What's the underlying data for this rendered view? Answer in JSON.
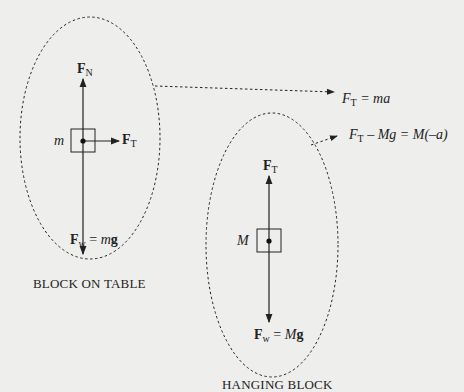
{
  "block_on_table": {
    "mass_label": "m",
    "normal_force": {
      "symbol": "F",
      "sub": "N"
    },
    "tension_force": {
      "symbol": "F",
      "sub": "T"
    },
    "weight": {
      "symbol": "F",
      "sub": "w",
      "eq": " = ",
      "m": "m",
      "g": "g"
    },
    "caption": "BLOCK ON TABLE",
    "equation": {
      "F": "F",
      "sub": "T",
      "rest": " = ma"
    }
  },
  "hanging_block": {
    "mass_label": "M",
    "tension_force": {
      "symbol": "F",
      "sub": "T"
    },
    "weight": {
      "symbol": "F",
      "sub": "w",
      "eq": " = ",
      "m": "M",
      "g": "g"
    },
    "caption": "HANGING BLOCK",
    "equation": {
      "F": "F",
      "sub": "T",
      "rest": " – Mg = M(–a)"
    }
  },
  "colors": {
    "background": "#eeeeec",
    "ink": "#222222"
  }
}
